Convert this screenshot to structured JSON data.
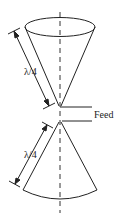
{
  "diagram": {
    "labels": {
      "top_length": "λ/4",
      "bottom_length": "λ/4",
      "feed": "Feed"
    },
    "colors": {
      "stroke": "#222222",
      "background": "#ffffff"
    }
  }
}
